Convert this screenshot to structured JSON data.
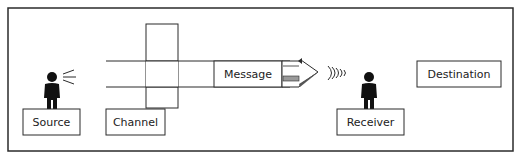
{
  "diagram": {
    "labels": {
      "source": "Source",
      "channel": "Channel",
      "message": "Message",
      "receiver": "Receiver",
      "destination": "Destination"
    },
    "colors": {
      "stroke": "#2b2b2b",
      "figure": "#111111",
      "hatch": "#9a9a9a",
      "background": "#ffffff"
    },
    "icons": [
      "speaker-person-icon",
      "speech-lines-icon",
      "arrow-head-icon",
      "sound-waves-icon",
      "listener-person-icon"
    ]
  }
}
